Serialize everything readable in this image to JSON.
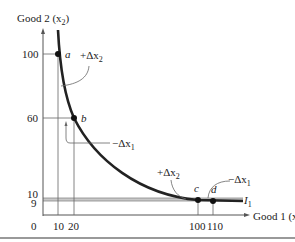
{
  "diagram": {
    "y_axis_label": "Good 2 (x",
    "y_axis_label_sub": "2",
    "x_axis_label": "Good 1 (x",
    "x_axis_label_sub": "1",
    "curve_label": "I",
    "curve_label_sub": "1",
    "origin": "0",
    "y_ticks": [
      "100",
      "60",
      "10",
      "9"
    ],
    "x_ticks": [
      "10",
      "20",
      "100",
      "110"
    ],
    "points": [
      {
        "label": "a",
        "x": 10,
        "y": 100
      },
      {
        "label": "b",
        "x": 20,
        "y": 60
      },
      {
        "label": "c",
        "x": 100,
        "y": 10
      },
      {
        "label": "d",
        "x": 110,
        "y": 9
      }
    ],
    "annotations": {
      "plus_dx2_top": "+Δx",
      "plus_dx2_top_sub": "2",
      "minus_dx1_mid": "−Δx",
      "minus_dx1_mid_sub": "1",
      "plus_dx2_bottom": "+Δx",
      "plus_dx2_bottom_sub": "2",
      "minus_dx1_bottom": "−Δx",
      "minus_dx1_bottom_sub": "1"
    },
    "colors": {
      "curve": "#222222",
      "axis": "#555555",
      "guide": "#666666",
      "band": "#bbbbbb"
    }
  }
}
